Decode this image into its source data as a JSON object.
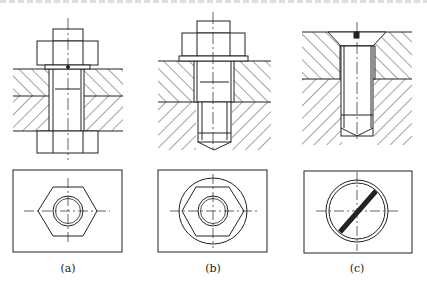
{
  "figure": {
    "stroke_color": "#222222",
    "hatch_color": "#333333",
    "panels": [
      {
        "id": "a",
        "caption": "(a)",
        "type": "through-bolt with nut",
        "plan_view": "hexagon with circle"
      },
      {
        "id": "b",
        "caption": "(b)",
        "type": "hex bolt into threaded hole",
        "plan_view": "hexagon inscribed in circle with inner circle"
      },
      {
        "id": "c",
        "caption": "(c)",
        "type": "countersunk slotted screw",
        "plan_view": "double circle with diagonal slot"
      }
    ]
  }
}
